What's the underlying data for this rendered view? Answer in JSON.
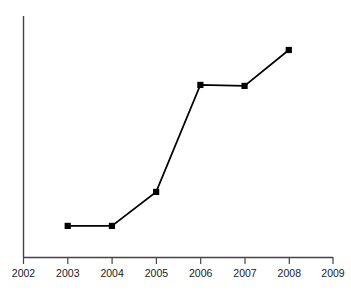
{
  "chart_data": {
    "type": "line",
    "title": "",
    "xlabel": "",
    "ylabel": "",
    "categories": [
      2003,
      2004,
      2005,
      2006,
      2007,
      2008
    ],
    "values": [
      0.129,
      0.129,
      0.27,
      0.714,
      0.71,
      0.859
    ],
    "series": [
      {
        "name": "series-1",
        "values": [
          0.129,
          0.129,
          0.27,
          0.714,
          0.71,
          0.859
        ]
      }
    ],
    "xlim": [
      2002,
      2009
    ],
    "ylim": [
      0,
      1
    ],
    "xticks": [
      2002,
      2003,
      2004,
      2005,
      2006,
      2007,
      2008,
      2009
    ],
    "xtick_labels": [
      "2002",
      "2003",
      "2004",
      "2005",
      "2006",
      "2007",
      "2008",
      "2009"
    ],
    "yticks": [],
    "ytick_labels": [],
    "grid": false,
    "legend": false,
    "legend_position": "none",
    "marker": "filled-square",
    "marker_color": "#000000",
    "line_color": "#000000",
    "axis_color": "#444444",
    "background_color": "#ffffff",
    "annotations": []
  },
  "axes": {
    "x_axis_name": "x-axis",
    "y_axis_name": "y-axis"
  },
  "title_fragment": {
    "text": "",
    "note": "clipped-at-top-edge"
  }
}
